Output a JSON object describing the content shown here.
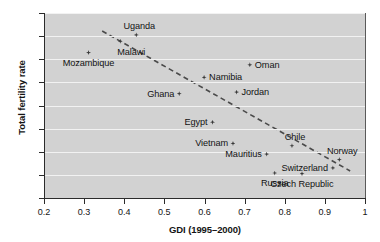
{
  "chart_data": {
    "type": "scatter",
    "title": "",
    "xlabel": "GDI (1995–2000)",
    "ylabel": "Total fertility rate",
    "xlim": [
      0.2,
      1.0
    ],
    "ylim": [
      0,
      8
    ],
    "xticks": [
      "0.2",
      "0.3",
      "0.4",
      "0.5",
      "0.6",
      "0.7",
      "0.8",
      "0.9",
      "1"
    ],
    "xtick_values": [
      0.2,
      0.3,
      0.4,
      0.5,
      0.6,
      0.7,
      0.8,
      0.9,
      1.0
    ],
    "yticks": [
      "0",
      "1",
      "2",
      "3",
      "4",
      "5",
      "6",
      "7",
      "8"
    ],
    "ytick_values": [
      0,
      1,
      2,
      3,
      4,
      5,
      6,
      7,
      8
    ],
    "grid": "horizontal",
    "legend": "none",
    "plot_background": "#d2d2d2",
    "gridline_color": "#f2f2f2",
    "marker_color": "#3a3a3a",
    "trendline_color": "#4a4a4a",
    "trendline": {
      "style": "dashed",
      "x0": 0.345,
      "y0": 7.22,
      "x1": 0.963,
      "y1": 1.17
    },
    "points": [
      {
        "label": "Mozambique",
        "x": 0.311,
        "y": 6.29,
        "label_pos": "below"
      },
      {
        "label": "Malawi",
        "x": 0.39,
        "y": 6.78,
        "label_pos": "below-right"
      },
      {
        "label": "Uganda",
        "x": 0.43,
        "y": 7.05,
        "label_pos": "above-right"
      },
      {
        "label": "Ghana",
        "x": 0.537,
        "y": 4.51,
        "label_pos": "left"
      },
      {
        "label": "Namibia",
        "x": 0.599,
        "y": 5.22,
        "label_pos": "right"
      },
      {
        "label": "Egypt",
        "x": 0.62,
        "y": 3.28,
        "label_pos": "left"
      },
      {
        "label": "Vietnam",
        "x": 0.671,
        "y": 2.36,
        "label_pos": "left"
      },
      {
        "label": "Jordan",
        "x": 0.68,
        "y": 4.58,
        "label_pos": "right"
      },
      {
        "label": "Oman",
        "x": 0.713,
        "y": 5.76,
        "label_pos": "right"
      },
      {
        "label": "Mauritius",
        "x": 0.755,
        "y": 1.9,
        "label_pos": "left"
      },
      {
        "label": "Russia",
        "x": 0.775,
        "y": 1.08,
        "label_pos": "below"
      },
      {
        "label": "Chile",
        "x": 0.818,
        "y": 2.26,
        "label_pos": "above-right"
      },
      {
        "label": "Czech Republic",
        "x": 0.843,
        "y": 1.05,
        "label_pos": "below"
      },
      {
        "label": "Switzerland",
        "x": 0.92,
        "y": 1.3,
        "label_pos": "left"
      },
      {
        "label": "Norway",
        "x": 0.936,
        "y": 1.66,
        "label_pos": "above-right"
      }
    ]
  }
}
